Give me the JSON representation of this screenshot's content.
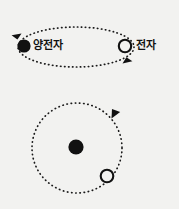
{
  "figure": {
    "title": "",
    "background_color": "#f2f2f0",
    "ink_color": "#111111"
  },
  "panels": [
    {
      "id": "pair-panel",
      "name": "positron-electron-pair",
      "orbit": {
        "shape": "ellipse",
        "center": [
          76,
          47
        ],
        "rx": 58,
        "ry": 20,
        "style": "dotted",
        "direction": "counterclockwise"
      },
      "particles": [
        {
          "name": "positron",
          "label": "양전자",
          "marker": "filled-circle",
          "fill": "#111111",
          "center": [
            24,
            46
          ],
          "radius": 6.5
        },
        {
          "name": "electron",
          "label": "전자",
          "marker": "hollow-circle",
          "fill": "#f2f2f0",
          "center": [
            125,
            46
          ],
          "radius": 6.5
        }
      ],
      "arrows": [
        {
          "name": "left-arrowhead",
          "at": [
            22,
            34
          ],
          "angle_deg": 205
        },
        {
          "name": "right-arrowhead",
          "at": [
            124,
            62
          ],
          "angle_deg": 27
        }
      ]
    },
    {
      "id": "orbit-panel",
      "name": "electron-orbiting-nucleus",
      "orbit": {
        "shape": "circle",
        "center": [
          77,
          148
        ],
        "r": 45,
        "style": "dotted",
        "direction": "counterclockwise"
      },
      "particles": [
        {
          "name": "nucleus",
          "label": "",
          "marker": "filled-circle",
          "fill": "#111111",
          "center": [
            76,
            147
          ],
          "radius": 7.5
        },
        {
          "name": "electron",
          "label": "",
          "marker": "hollow-circle",
          "fill": "#f2f2f0",
          "center": [
            107,
            176
          ],
          "radius": 6.5
        }
      ],
      "arrows": [
        {
          "name": "orbit-arrowhead",
          "at": [
            116,
            117
          ],
          "angle_deg": 300
        }
      ]
    }
  ],
  "labels": {
    "positron": "양전자",
    "electron": "전자"
  }
}
